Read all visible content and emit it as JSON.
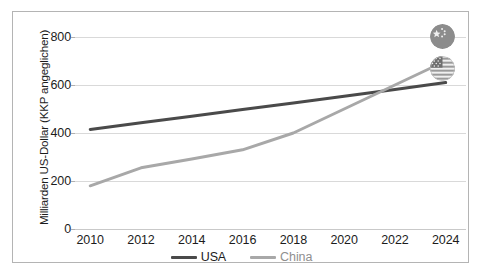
{
  "chart_data": {
    "type": "line",
    "title": "",
    "xlabel": "",
    "ylabel": "Milliarden US-Dollar (KKP angeglichen)",
    "x": [
      2010,
      2012,
      2014,
      2016,
      2018,
      2020,
      2022,
      2024
    ],
    "xtick_labels": [
      "2010",
      "2012",
      "2014",
      "2016",
      "2018",
      "2020",
      "2022",
      "2024"
    ],
    "ytick_labels": [
      "0",
      "200",
      "400",
      "600",
      "800"
    ],
    "ytick_values": [
      0,
      200,
      400,
      600,
      800
    ],
    "ylim": [
      0,
      850
    ],
    "xlim": [
      2009.4,
      2024.8
    ],
    "grid": true,
    "legend_position": "bottom-center",
    "series": [
      {
        "name": "USA",
        "color": "#4a4a4a",
        "values": [
          415,
          443,
          470,
          498,
          525,
          553,
          581,
          610
        ]
      },
      {
        "name": "China",
        "color": "#a8a8a8",
        "values": [
          180,
          255,
          292,
          330,
          400,
          500,
          600,
          700
        ]
      }
    ]
  },
  "legend": {
    "entries": [
      {
        "label": "USA",
        "color": "#4a4a4a"
      },
      {
        "label": "China",
        "color": "#a8a8a8"
      }
    ]
  },
  "badges": [
    {
      "name": "china-flag-badge",
      "label": "China"
    },
    {
      "name": "usa-flag-badge",
      "label": "USA"
    }
  ]
}
